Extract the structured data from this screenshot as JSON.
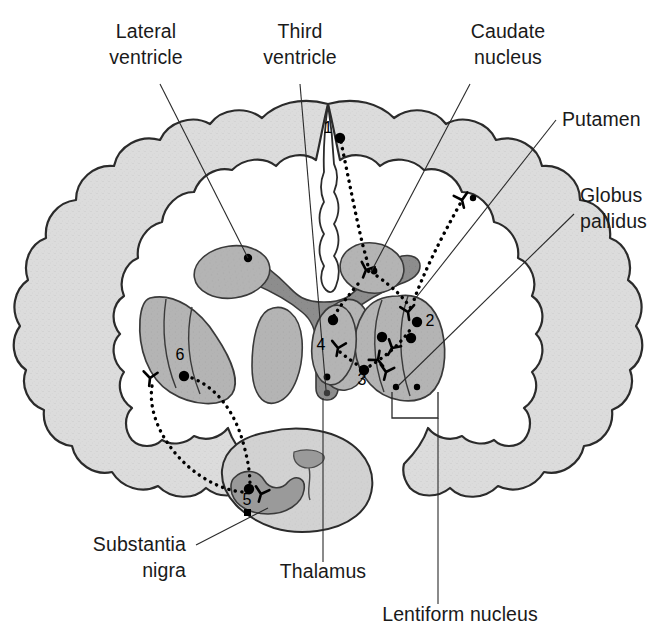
{
  "figure": {
    "background_color": "#ffffff"
  },
  "colors": {
    "cortex_fill": "#dcdcdc",
    "cortex_stroke": "#2b2b2b",
    "ventricle_fill": "#8d8d8d",
    "ventricle_stroke": "#3a3a3a",
    "nucleus_fill": "#b4b4b4",
    "nucleus_stroke": "#3a3a3a",
    "lentiform_fill": "#a8a8a8",
    "midbrain_fill": "#d2d2d2",
    "nigra_fill": "#9a9a9a",
    "marker_color": "#000000",
    "text_color": "#1a1a1a",
    "leader_color": "#2a2a2a"
  },
  "labels": [
    {
      "id": "lateral-ventricle",
      "lines": [
        "Lateral",
        "ventricle"
      ],
      "anchor": "middle",
      "x": 146,
      "y": 38,
      "line_height": 26
    },
    {
      "id": "third-ventricle",
      "lines": [
        "Third",
        "ventricle"
      ],
      "anchor": "middle",
      "x": 300,
      "y": 38,
      "line_height": 26
    },
    {
      "id": "caudate-nucleus",
      "lines": [
        "Caudate",
        "nucleus"
      ],
      "anchor": "middle",
      "x": 508,
      "y": 38,
      "line_height": 26
    },
    {
      "id": "putamen",
      "lines": [
        "Putamen"
      ],
      "anchor": "start",
      "x": 562,
      "y": 126,
      "line_height": 26
    },
    {
      "id": "globus-pallidus",
      "lines": [
        "Globus",
        "pallidus"
      ],
      "anchor": "start",
      "x": 580,
      "y": 202,
      "line_height": 26
    },
    {
      "id": "substantia-nigra",
      "lines": [
        "Substantia",
        "nigra"
      ],
      "anchor": "end",
      "x": 186,
      "y": 551,
      "line_height": 26
    },
    {
      "id": "thalamus",
      "lines": [
        "Thalamus"
      ],
      "anchor": "middle",
      "x": 323,
      "y": 578,
      "line_height": 26
    },
    {
      "id": "lentiform-nucleus",
      "lines": [
        "Lentiform nucleus"
      ],
      "anchor": "middle",
      "x": 460,
      "y": 621,
      "line_height": 26
    }
  ],
  "markers": [
    {
      "id": "marker-1",
      "number": "1",
      "label_x": 328,
      "label_y": 133,
      "dot_x": 340,
      "dot_y": 138,
      "radius": 5.2
    },
    {
      "id": "marker-2",
      "number": "2",
      "label_x": 430,
      "label_y": 326,
      "dot_x": 417,
      "dot_y": 322,
      "radius": 5.2
    },
    {
      "id": "marker-3",
      "number": "3",
      "label_x": 362,
      "label_y": 385,
      "dot_x": 364,
      "dot_y": 370,
      "radius": 5.2
    },
    {
      "id": "marker-4",
      "number": "4",
      "label_x": 321,
      "label_y": 350,
      "dot_x": 333,
      "dot_y": 320,
      "radius": 5.2
    },
    {
      "id": "marker-5",
      "number": "5",
      "label_x": 247,
      "label_y": 505,
      "dot_x": 249,
      "dot_y": 489,
      "radius": 5.2
    },
    {
      "id": "marker-6",
      "number": "6",
      "label_x": 180,
      "label_y": 360,
      "dot_x": 184,
      "dot_y": 376,
      "radius": 5.2
    }
  ],
  "structures": [
    {
      "id": "cerebral-cortex",
      "name": "cerebral cortex"
    },
    {
      "id": "lateral-ventricle-left",
      "name": "left lateral ventricle"
    },
    {
      "id": "lateral-ventricle-right",
      "name": "right lateral ventricle"
    },
    {
      "id": "third-ventricle",
      "name": "third ventricle"
    },
    {
      "id": "caudate-nucleus-left",
      "name": "left caudate nucleus"
    },
    {
      "id": "caudate-nucleus-right",
      "name": "right caudate nucleus"
    },
    {
      "id": "lentiform-nucleus-left",
      "name": "left lentiform nucleus"
    },
    {
      "id": "lentiform-nucleus-right",
      "name": "right lentiform nucleus"
    },
    {
      "id": "thalamus-left",
      "name": "left thalamus"
    },
    {
      "id": "thalamus-right",
      "name": "right thalamus"
    },
    {
      "id": "midbrain",
      "name": "midbrain"
    },
    {
      "id": "substantia-nigra",
      "name": "substantia nigra"
    },
    {
      "id": "cerebral-aqueduct",
      "name": "cerebral aqueduct"
    }
  ]
}
